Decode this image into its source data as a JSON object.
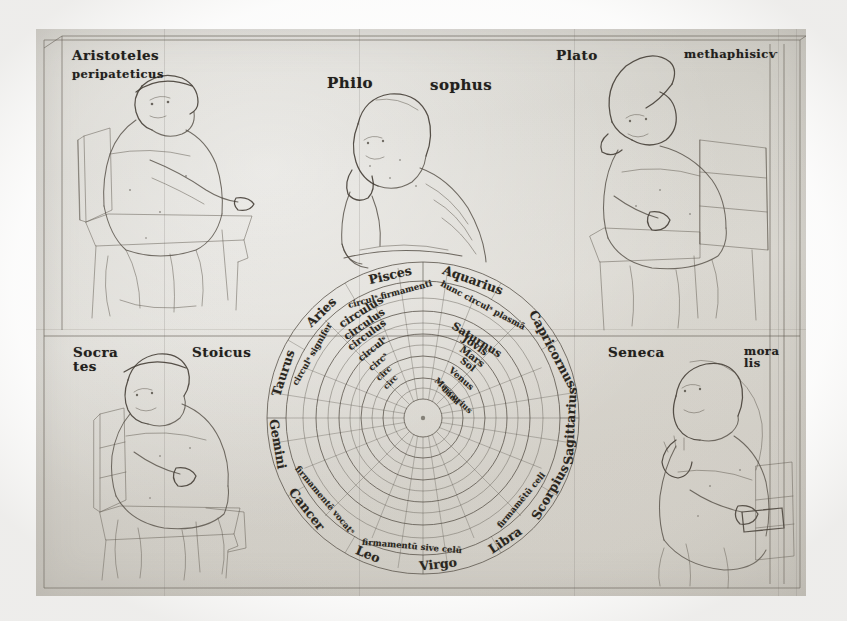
{
  "document": {
    "title": "Philosophers around a Geocentric Cosmological Wheel",
    "material": "parchment leaf, brown ink drawing",
    "background_color": "#d6d3cc",
    "ink_color": "#4a443b",
    "script_color": "#22201c"
  },
  "figures": [
    {
      "id": "aristotle",
      "position": "top-left",
      "name_label": "Aristoteles",
      "epithet_label": "peripateticus",
      "pose": "seated in chair, gesturing"
    },
    {
      "id": "philosophus",
      "position": "top-center",
      "name_label": "Philo",
      "epithet_label": "sophus",
      "pose": "seated, hand to chin, contemplative"
    },
    {
      "id": "plato",
      "position": "top-right",
      "name_label": "Plato",
      "epithet_label": "methaphisicѵ",
      "pose": "seated in chair, pointed cap, hand to face"
    },
    {
      "id": "socrates",
      "position": "bottom-left",
      "name_label": "Socra",
      "name_label_line2": "tes",
      "epithet_label": "Stoicus",
      "pose": "seated in chair, wearing cap"
    },
    {
      "id": "seneca",
      "position": "bottom-right",
      "name_label": "Seneca",
      "epithet_label": "mora",
      "epithet_label_line2": "lis",
      "pose": "seated, hand raised in speech gesture"
    }
  ],
  "wheel": {
    "caption": "Geocentric cosmos: zodiac band enclosing the planetary spheres",
    "center_label": "terra",
    "center_x": 423,
    "center_y": 418,
    "outer_radius": 156,
    "zodiac_ring": {
      "label": "signa zodiaci",
      "signs": [
        {
          "name": "Aquarius",
          "angle_deg": -70
        },
        {
          "name": "Pisces",
          "angle_deg": -103
        },
        {
          "name": "Aries",
          "angle_deg": -134
        },
        {
          "name": "Taurus",
          "angle_deg": -162
        },
        {
          "name": "Gemini",
          "angle_deg": 170
        },
        {
          "name": "Cancer",
          "angle_deg": 142
        },
        {
          "name": "Leo",
          "angle_deg": 112
        },
        {
          "name": "Virgo",
          "angle_deg": 84
        },
        {
          "name": "Libra",
          "angle_deg": 56
        },
        {
          "name": "Scorpius",
          "angle_deg": 30
        },
        {
          "name": "Sagittarius",
          "angle_deg": 3
        },
        {
          "name": "Capricornus",
          "angle_deg": -28
        }
      ]
    },
    "inscription_ring": {
      "label": "gloss band",
      "texts": [
        {
          "text": "circulˢ firmamenti",
          "angle_deg": -105
        },
        {
          "text": "hunc circulˢ plasmā",
          "angle_deg": -62
        },
        {
          "text": "circulˢ signifer",
          "angle_deg": -150
        },
        {
          "text": "firmamentē vocatˢ",
          "angle_deg": 140
        },
        {
          "text": "firmamentū sive celū",
          "angle_deg": 95
        },
        {
          "text": "firmamētū celi",
          "angle_deg": 40
        }
      ]
    },
    "planet_spheres": [
      {
        "name": "Saturnus",
        "ring_index": 1,
        "circulus_label": "circulus"
      },
      {
        "name": "Jovis",
        "ring_index": 2,
        "circulus_label": "circulus"
      },
      {
        "name": "Mars",
        "ring_index": 3,
        "circulus_label": "circulus"
      },
      {
        "name": "Sol",
        "ring_index": 4,
        "circulus_label": "circulˢ"
      },
      {
        "name": "Venus",
        "ring_index": 5,
        "circulus_label": "circˢ"
      },
      {
        "name": "Mercurius",
        "ring_index": 6,
        "circulus_label": "circ"
      },
      {
        "name": "Luna",
        "ring_index": 7,
        "circulus_label": "circ"
      }
    ],
    "ring_count": 11,
    "radial_spoke_count": 24
  }
}
